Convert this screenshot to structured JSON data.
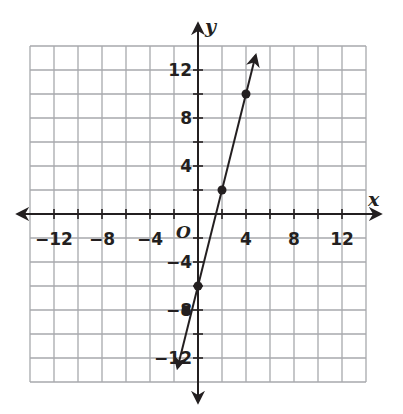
{
  "chart_data": {
    "type": "line",
    "title": "",
    "xlabel": "x",
    "ylabel": "y",
    "origin_label": "O",
    "xlim": [
      -14,
      14
    ],
    "ylim": [
      -14,
      14
    ],
    "grid": true,
    "grid_step": 2,
    "x_ticks": [
      -12,
      -8,
      -4,
      4,
      8,
      12
    ],
    "y_ticks": [
      12,
      8,
      4,
      -4,
      -8,
      -12
    ],
    "x_tick_labels": [
      "−12",
      "−8",
      "−4",
      "4",
      "8",
      "12"
    ],
    "y_tick_labels": [
      "12",
      "8",
      "4",
      "−4",
      "−8",
      "−12"
    ],
    "series": [
      {
        "name": "line",
        "equation": "y = 4x - 6",
        "points": [
          {
            "x": -1,
            "y": -8
          },
          {
            "x": 0,
            "y": -6
          },
          {
            "x": 2,
            "y": 2
          },
          {
            "x": 4,
            "y": 10
          }
        ],
        "arrows_both_ends": true,
        "color": "#231f20"
      }
    ],
    "colors": {
      "grid": "#a7a9ac",
      "axis": "#231f20",
      "point": "#231f20"
    }
  }
}
